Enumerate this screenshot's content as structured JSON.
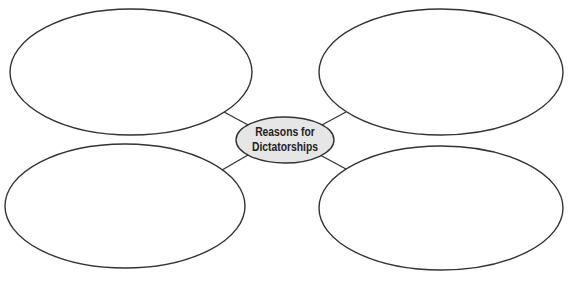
{
  "diagram": {
    "type": "concept-web",
    "center": {
      "line1": "Reasons for",
      "line2": "Dictatorships",
      "fill": "#e6e6e6",
      "stroke": "#333333"
    },
    "bubbles": [
      {
        "position": "top-left",
        "text": ""
      },
      {
        "position": "top-right",
        "text": ""
      },
      {
        "position": "bottom-left",
        "text": ""
      },
      {
        "position": "bottom-right",
        "text": ""
      }
    ],
    "stroke_color": "#333333",
    "background": "#ffffff"
  }
}
